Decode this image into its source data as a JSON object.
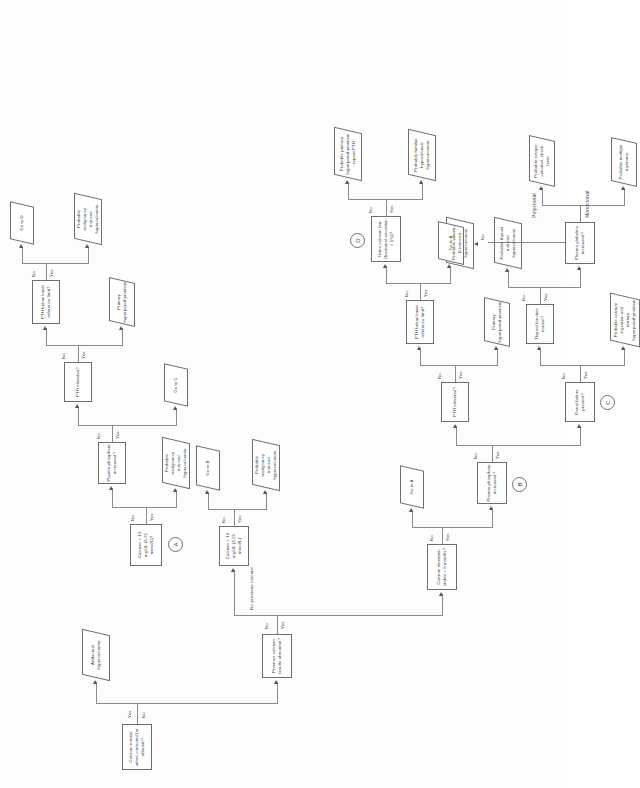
{
  "diagram": {
    "type": "flowchart",
    "orientation": "landscape content on portrait page, rotated 90 degrees counter-clockwise",
    "edge_labels": {
      "yes": "Yes",
      "no": "No",
      "monoclonal": "Monoclonal",
      "polyclonal": "Polyclonal"
    },
    "nodes": {
      "start": "Calcium normal when corrected for albumin?",
      "artifactual": "Artifactual hypercalcemia",
      "prev_results": "Previous calcium results abnormal?",
      "no_prev_calcium": "No previous calcium",
      "ca_stable": "Calcium elevation stable > 6 months?",
      "go_to_a_1": "Go to A",
      "plasma_phos_b": "Plasma phosphate increased?",
      "node_b": "B",
      "renal_failure": "Renal failure present?",
      "node_c": "C",
      "prob_ca_ingestion": "Probable calcium ingestion and tertiary hyperparathyroidism",
      "thyroid_fn": "Thyroid function normal?",
      "prob_thyroid": "Probable thyroid induced hypercalcemia",
      "plasma_glob": "Plasma globulins increased?",
      "prob_myeloma": "Probable multiple myeloma",
      "prob_ectopic": "Probable ectopic calcitriol, check level",
      "prob_vitd": "Probable vitamin D induced hypercalcemia",
      "pth_elev_mid": "PTH elevated?",
      "primary_hpt_mid": "Primary hyperparathyroidism",
      "pth_below_mid": "PTH below lower reference limit?",
      "go_to_a_2": "Go to A",
      "urine_ca": "Urine calcium low (fractional excretion < 1%)?",
      "node_d": "D",
      "prob_familial": "Probably familial hypocalciuric hypercalcemia",
      "prob_primary_repeat": "Probable primary hyperparathyroidism - repeat PTH",
      "ca_13_low": "Calcium > 13 mg/dL (3.25 mmol/L)",
      "prob_malig_1": "Probable malignancy induced hypercalcemia",
      "go_to_b": "Go to B",
      "ca_13_high": "Calcium > 13 mg/dL (3.25 mmol/L)?",
      "node_a": "A",
      "prob_malig_2": "Probable malignancy induced hypercalcemia",
      "plasma_phos_a": "Plasma phosphate increased?",
      "go_to_c": "Go to C",
      "pth_elev_top": "PTH elevated?",
      "primary_hpt_top": "Primary hyperparathyroidism",
      "pth_below_top": "PTH below lower reference limit?",
      "prob_malig_3": "Probable malignancy induced hypercalcemia",
      "go_to_d": "Go to D"
    }
  },
  "colors": {
    "line": "#8a8a8a",
    "box_border": "#6e6e6e",
    "text": "#3b3b3b",
    "paper": "#fdfdfd"
  }
}
